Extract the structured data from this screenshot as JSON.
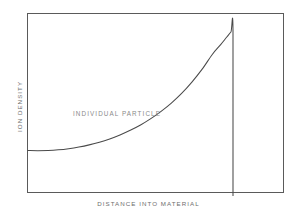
{
  "figure": {
    "background_color": "#ffffff",
    "frame_color": "#5a5a5a",
    "curve_color": "#4a4a4a",
    "label_color": "#6e6e6e",
    "annotation_color": "#8a8a8a"
  },
  "axes": {
    "y_label": "ION DENSITY",
    "x_label": "DISTANCE INTO MATERIAL"
  },
  "annotations": {
    "curve_label": "INDIVIDUAL PARTICLE"
  },
  "chart_data": {
    "type": "line",
    "title": "",
    "subtitle": "",
    "xlabel": "DISTANCE INTO MATERIAL",
    "ylabel": "ION DENSITY",
    "xlim": [
      0,
      1
    ],
    "ylim": [
      0,
      1
    ],
    "grid": false,
    "legend": null,
    "tick_labels": {
      "x": [],
      "y": []
    },
    "annotations": [
      {
        "text": "INDIVIDUAL PARTICLE",
        "x": 0.33,
        "y": 0.47,
        "description": "label placed above the slowly rising portion of the Bragg curve"
      }
    ],
    "series": [
      {
        "name": "INDIVIDUAL PARTICLE",
        "description": "Bragg curve: ion density stays low and nearly flat with increasing depth, rises gradually, then climbs steeply to a sharp Bragg peak and falls abruptly to zero at the end of range.",
        "x": [
          0.0,
          0.05,
          0.1,
          0.15,
          0.2,
          0.25,
          0.3,
          0.35,
          0.4,
          0.45,
          0.5,
          0.55,
          0.6,
          0.65,
          0.7,
          0.75,
          0.8,
          0.85,
          0.9,
          0.94,
          0.97,
          0.99,
          1.0,
          1.0
        ],
        "y": [
          0.274,
          0.273,
          0.274,
          0.278,
          0.285,
          0.295,
          0.308,
          0.324,
          0.344,
          0.368,
          0.396,
          0.428,
          0.466,
          0.51,
          0.56,
          0.618,
          0.686,
          0.764,
          0.854,
          0.912,
          0.958,
          0.988,
          1.0,
          0.0
        ]
      }
    ],
    "peak": {
      "x": 1.0,
      "y": 1.0,
      "note": "Bragg peak at end of particle range"
    },
    "baseline_value": 0.274
  }
}
